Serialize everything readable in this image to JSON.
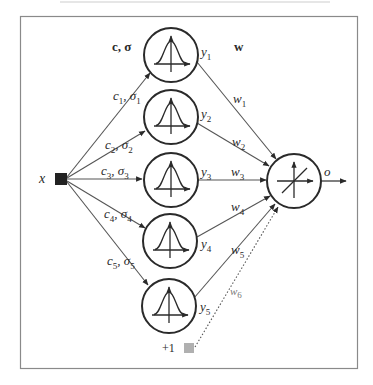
{
  "diagram": {
    "type": "rbf-neural-network",
    "input": {
      "label": "x",
      "node_color": "#222222"
    },
    "bias": {
      "label": "+1",
      "node_color": "#b0b0b0"
    },
    "header_labels": {
      "params": "c, σ",
      "weights": "w"
    },
    "hidden_units": [
      {
        "id": 1,
        "edge_label_c": "c",
        "edge_label_c_sub": "1",
        "edge_label_s": "σ",
        "edge_label_s_sub": "1",
        "output_label": "y",
        "output_sub": "1",
        "weight": "w",
        "weight_sub": "1"
      },
      {
        "id": 2,
        "edge_label_c": "c",
        "edge_label_c_sub": "2",
        "edge_label_s": "σ",
        "edge_label_s_sub": "2",
        "output_label": "y",
        "output_sub": "2",
        "weight": "w",
        "weight_sub": "2"
      },
      {
        "id": 3,
        "edge_label_c": "c",
        "edge_label_c_sub": "3",
        "edge_label_s": "σ",
        "edge_label_s_sub": "3",
        "output_label": "y",
        "output_sub": "3",
        "weight": "w",
        "weight_sub": "3"
      },
      {
        "id": 4,
        "edge_label_c": "c",
        "edge_label_c_sub": "4",
        "edge_label_s": "σ",
        "edge_label_s_sub": "4",
        "output_label": "y",
        "output_sub": "4",
        "weight": "w",
        "weight_sub": "4"
      },
      {
        "id": 5,
        "edge_label_c": "c",
        "edge_label_c_sub": "5",
        "edge_label_s": "σ",
        "edge_label_s_sub": "5",
        "output_label": "y",
        "output_sub": "5",
        "weight": "w",
        "weight_sub": "5"
      }
    ],
    "bias_weight": {
      "label": "w",
      "sub": "6"
    },
    "output": {
      "label": "o",
      "activation": "linear"
    },
    "colors": {
      "stroke": "#2a2a2a",
      "edge": "#555555",
      "border": "#8a8a8a"
    }
  }
}
